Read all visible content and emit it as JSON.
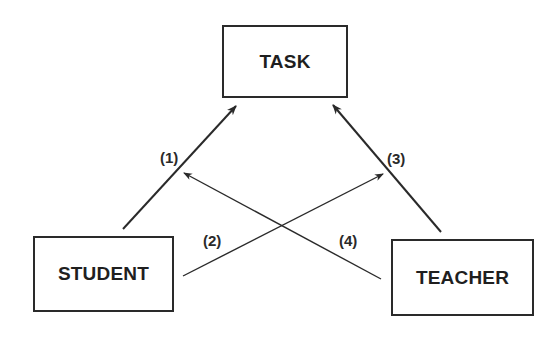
{
  "diagram": {
    "type": "triangle relationship diagram",
    "colors": {
      "background": "#ffffff",
      "stroke": "#2a2a2a",
      "text": "#1f1f1f"
    },
    "nodes": {
      "task": {
        "label": "TASK"
      },
      "student": {
        "label": "STUDENT"
      },
      "teacher": {
        "label": "TEACHER"
      }
    },
    "edges": [
      {
        "id": "1",
        "label": "(1)",
        "from": "STUDENT",
        "to": "TASK"
      },
      {
        "id": "2",
        "label": "(2)",
        "from": "STUDENT",
        "to": "TEACHER-TASK arrow"
      },
      {
        "id": "3",
        "label": "(3)",
        "from": "TEACHER",
        "to": "TASK"
      },
      {
        "id": "4",
        "label": "(4)",
        "from": "TEACHER",
        "to": "STUDENT-TASK arrow"
      }
    ]
  }
}
